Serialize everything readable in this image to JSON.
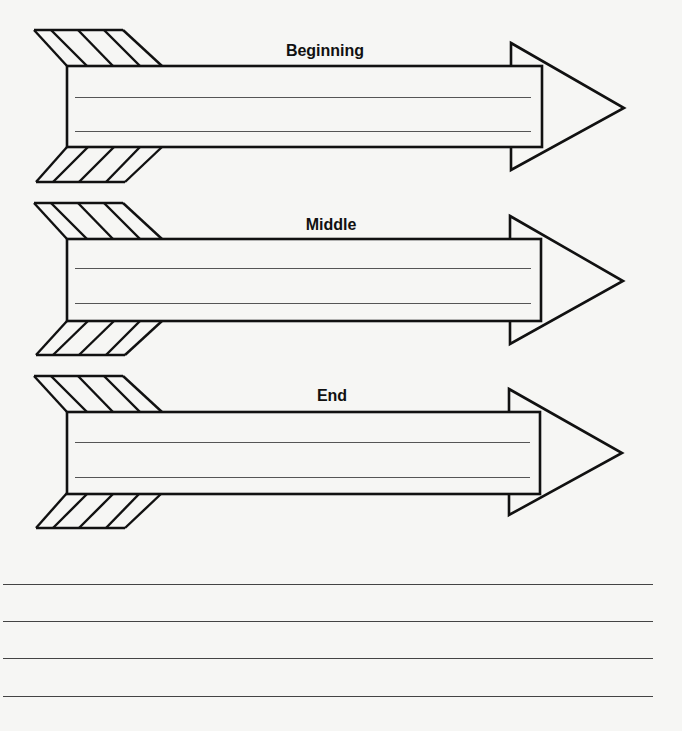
{
  "worksheet": {
    "arrows": [
      {
        "label": "Beginning",
        "writing_lines": 2
      },
      {
        "label": "Middle",
        "writing_lines": 2
      },
      {
        "label": "End",
        "writing_lines": 2
      }
    ],
    "bottom_writing_lines": 4
  },
  "colors": {
    "paper": "#f6f6f4",
    "stroke": "#111111",
    "ruled_line": "#555555"
  }
}
